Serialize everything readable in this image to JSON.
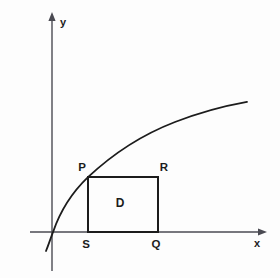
{
  "figure": {
    "background_color": "#fdfdfd",
    "ink_color": "#1c1c1c",
    "axis_color": "#4a4a52"
  },
  "axes": {
    "x_label": "x",
    "y_label": "y",
    "origin": {
      "x": 52,
      "y": 232
    },
    "x_axis": {
      "x1": 30,
      "y1": 232,
      "x2": 266,
      "y2": 232
    },
    "y_axis": {
      "x1": 52,
      "y1": 14,
      "x2": 52,
      "y2": 271
    },
    "x_label_pos": {
      "x": 256,
      "y": 246
    },
    "y_label_pos": {
      "x": 63,
      "y": 25
    }
  },
  "curve": {
    "name": "concave-increasing-curve",
    "description": "increasing concave-down curve crossing the x-axis near the origin",
    "path": "M 46,251 C 49,243 51,237 53,232 C 60,212 72,192 88,177 C 110,157 140,135 175,122 C 200,112 228,105 247,102",
    "start": {
      "x": 46,
      "y": 251
    },
    "x_intercept": {
      "x": 53,
      "y": 232
    },
    "end": {
      "x": 247,
      "y": 102
    }
  },
  "rectangle": {
    "name": "region-D",
    "label": "D",
    "label_pos": {
      "x": 120,
      "y": 207
    },
    "left": 88,
    "right": 158,
    "top": 177,
    "bottom": 232
  },
  "points": [
    {
      "id": "P",
      "label": "P",
      "x": 88,
      "y": 177,
      "label_x": 82,
      "label_y": 170
    },
    {
      "id": "R",
      "label": "R",
      "x": 158,
      "y": 177,
      "label_x": 163,
      "label_y": 170
    },
    {
      "id": "S",
      "label": "S",
      "x": 88,
      "y": 232,
      "label_x": 84,
      "label_y": 247
    },
    {
      "id": "Q",
      "label": "Q",
      "x": 158,
      "y": 232,
      "label_x": 154,
      "label_y": 247
    }
  ]
}
